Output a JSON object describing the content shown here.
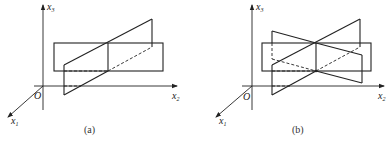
{
  "figure": {
    "panels": [
      {
        "id": "a",
        "caption": "(a)",
        "axes": {
          "vertical": {
            "label": "x",
            "subscript": "3"
          },
          "horizontal": {
            "label": "x",
            "subscript": "2"
          },
          "oblique": {
            "label": "x",
            "subscript": "1"
          },
          "origin": "O"
        },
        "description": "Horizontal rectangle plane intersected by one inclined parallelogram plane"
      },
      {
        "id": "b",
        "caption": "(b)",
        "axes": {
          "vertical": {
            "label": "x",
            "subscript": "3"
          },
          "horizontal": {
            "label": "x",
            "subscript": "2"
          },
          "oblique": {
            "label": "x",
            "subscript": "1"
          },
          "origin": "O"
        },
        "description": "Horizontal rectangle plane intersected by two inclined parallelogram planes meeting along a common line"
      }
    ]
  }
}
